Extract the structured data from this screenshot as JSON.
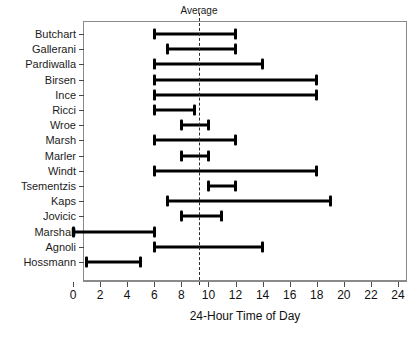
{
  "chart_data": {
    "type": "bar",
    "title": "",
    "subtitle": "",
    "xlabel": "24-Hour Time of Day",
    "ylabel": "",
    "xlim": [
      0,
      24
    ],
    "xticks": [
      0,
      2,
      4,
      6,
      8,
      10,
      12,
      14,
      16,
      18,
      20,
      22,
      24
    ],
    "xtick_labels": [
      "0",
      "2",
      "4",
      "6",
      "8",
      "10",
      "12",
      "14",
      "16",
      "18",
      "20",
      "22",
      "24"
    ],
    "grid": false,
    "legend": null,
    "orientation": "horizontal",
    "bar_style": "range-bar-with-end-caps",
    "categories": [
      "Butchart",
      "Gallerani",
      "Pardiwalla",
      "Birsen",
      "Ince",
      "Ricci",
      "Wroe",
      "Marsh",
      "Marler",
      "Windt",
      "Tsementzis",
      "Kaps",
      "Jovicic",
      "Marshall",
      "Agnoli",
      "Hossmann"
    ],
    "ranges": [
      {
        "label": "Butchart",
        "start": 6,
        "end": 12
      },
      {
        "label": "Gallerani",
        "start": 7,
        "end": 12
      },
      {
        "label": "Pardiwalla",
        "start": 6,
        "end": 14
      },
      {
        "label": "Birsen",
        "start": 6,
        "end": 18
      },
      {
        "label": "Ince",
        "start": 6,
        "end": 18
      },
      {
        "label": "Ricci",
        "start": 6,
        "end": 9
      },
      {
        "label": "Wroe",
        "start": 8,
        "end": 10
      },
      {
        "label": "Marsh",
        "start": 6,
        "end": 12
      },
      {
        "label": "Marler",
        "start": 8,
        "end": 10
      },
      {
        "label": "Windt",
        "start": 6,
        "end": 18
      },
      {
        "label": "Tsementzis",
        "start": 10,
        "end": 12
      },
      {
        "label": "Kaps",
        "start": 7,
        "end": 19
      },
      {
        "label": "Jovicic",
        "start": 8,
        "end": 11
      },
      {
        "label": "Marshall",
        "start": 0,
        "end": 6
      },
      {
        "label": "Agnoli",
        "start": 6,
        "end": 14
      },
      {
        "label": "Hossmann",
        "start": 1,
        "end": 5
      }
    ],
    "annotations": [
      {
        "name": "average-line",
        "label": "Average",
        "value": 9.3,
        "style": "dashed-vertical"
      }
    ],
    "colors": {
      "bar": "#000000",
      "frame": "#8a8a8a",
      "text": "#111111",
      "average_line": "#2b2b2b",
      "background": "#ffffff"
    }
  },
  "average": {
    "label": "Average",
    "value": 9.3
  },
  "axis": {
    "title": "24-Hour Time of Day"
  }
}
